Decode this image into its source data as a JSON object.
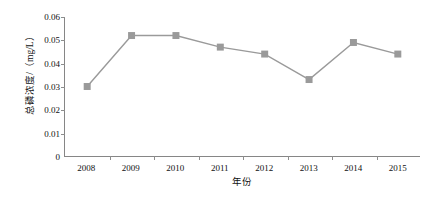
{
  "chart_data": {
    "type": "line",
    "title": "",
    "xlabel": "年份",
    "ylabel": "总磷浓度/（mg/L）",
    "categories": [
      "2008",
      "2009",
      "2010",
      "2011",
      "2012",
      "2013",
      "2014",
      "2015"
    ],
    "values": [
      0.03,
      0.052,
      0.052,
      0.047,
      0.044,
      0.033,
      0.049,
      0.044
    ],
    "series": [
      {
        "name": "总磷浓度",
        "values": [
          0.03,
          0.052,
          0.052,
          0.047,
          0.044,
          0.033,
          0.049,
          0.044
        ]
      }
    ],
    "ylim": [
      0,
      0.06
    ],
    "ytick_labels": [
      "0",
      "0.01",
      "0.02",
      "0.03",
      "0.04",
      "0.05",
      "0.06"
    ],
    "ytick_values": [
      0,
      0.01,
      0.02,
      0.03,
      0.04,
      0.05,
      0.06
    ],
    "grid": false,
    "legend": "none",
    "marker": "square",
    "colors": {
      "line": "#9a9a9a",
      "marker": "#9a9a9a",
      "axis": "#868686",
      "text": "#111111",
      "background": "#ffffff"
    }
  }
}
